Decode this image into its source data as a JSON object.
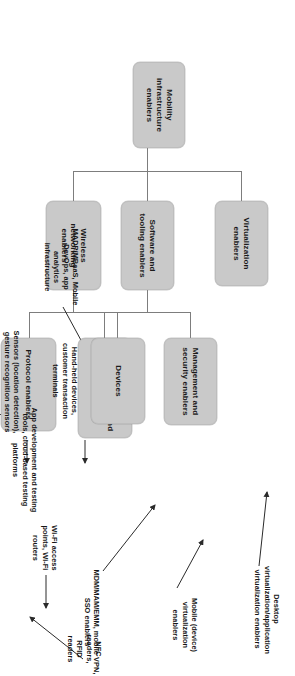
{
  "diagram": {
    "title": "Mobility infrastructure enablers",
    "type": "hierarchy-tree",
    "orientation": "rotated-90-clockwise",
    "colors": {
      "node_fill": "#c9c9c9",
      "node_border": "#bdbdbd",
      "connector": "#7d7d7d",
      "text": "#1a1a1a",
      "background": "#ffffff"
    },
    "nodes": {
      "root": "Mobility infrastructure enablers",
      "virtualization": "Virtualization enablers",
      "software_tooling": "Software and tooling enablers",
      "management_security": "Management and security enablers",
      "app_dev_testing": "App development and testing enablers",
      "wireless_networking": "Wireless networking enablers",
      "devices": "Devices",
      "protocol": "Protocol enablers"
    },
    "annotations": {
      "desktop_virtualization": "Desktop virtualization/application virtualization enablers",
      "mobile_device_virtualization": "Mobile (device) virtualization enablers",
      "mdm_mam_emm": "MDM/MAM/EMM, mobile VPN, SSO enablers",
      "madp_mbaas": "MADP/MBaaS, Mobile DevOps, app analytics infrastructure",
      "app_dev_tools": "App development and testing tools, cloud-based testing platforms",
      "hand_held_devices": "Hand-held devices, customer transaction terminals",
      "wifi_access": "Wi-Fi access points, Wi-Fi routers",
      "sensors": "Sensors (location detection), gesture recognition sensors",
      "nfc_rfid": "NFC readers, RFID readers",
      "bluetooth_le": "Bluetooth LE enablers, beacons"
    },
    "edges": [
      {
        "from": "root",
        "to": "virtualization"
      },
      {
        "from": "root",
        "to": "software_tooling"
      },
      {
        "from": "root",
        "to": "wireless_networking"
      },
      {
        "from": "software_tooling",
        "to": "management_security"
      },
      {
        "from": "software_tooling",
        "to": "app_dev_testing"
      },
      {
        "from": "wireless_networking",
        "to": "devices"
      },
      {
        "from": "wireless_networking",
        "to": "protocol"
      }
    ],
    "annotation_links": [
      {
        "label": "desktop_virtualization",
        "target": "virtualization"
      },
      {
        "label": "mobile_device_virtualization",
        "target": "virtualization"
      },
      {
        "label": "mdm_mam_emm",
        "target": "management_security"
      },
      {
        "label": "madp_mbaas",
        "target": "app_dev_testing"
      },
      {
        "label": "app_dev_tools",
        "target": "app_dev_testing"
      },
      {
        "label": "hand_held_devices",
        "target": "devices"
      },
      {
        "label": "wifi_access",
        "target": "protocol"
      },
      {
        "label": "sensors",
        "target": "protocol"
      },
      {
        "label": "nfc_rfid",
        "target": "protocol"
      },
      {
        "label": "bluetooth_le",
        "target": "protocol"
      }
    ]
  }
}
